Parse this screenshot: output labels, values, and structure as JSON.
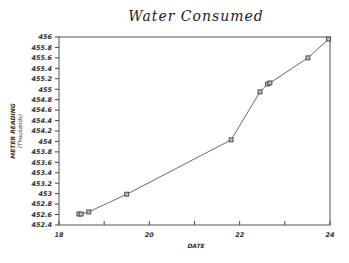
{
  "chart_data": {
    "type": "line",
    "title": "Water Consumed",
    "xlabel": "DATE",
    "ylabel": "METER READING",
    "ylabel_sub": "(Thousands)",
    "xlim": [
      18,
      24
    ],
    "ylim": [
      452.4,
      456
    ],
    "x_ticks": [
      18,
      19,
      20,
      21,
      22,
      23,
      24
    ],
    "x_tick_labels": [
      "18",
      "",
      "20",
      "",
      "22",
      "",
      "24"
    ],
    "y_ticks": [
      452.4,
      452.6,
      452.8,
      453,
      453.2,
      453.4,
      453.6,
      453.8,
      454,
      454.2,
      454.4,
      454.6,
      454.8,
      455,
      455.2,
      455.4,
      455.6,
      455.8,
      456
    ],
    "y_tick_labels": [
      "452.4",
      "452.6",
      "452.8",
      "453",
      "453.2",
      "453.4",
      "453.6",
      "453.8",
      "454",
      "454.2",
      "454.4",
      "454.6",
      "454.8",
      "455",
      "455.2",
      "455.4",
      "455.6",
      "455.8",
      "456"
    ],
    "grid": false,
    "legend": null,
    "marker": "square",
    "series": [
      {
        "name": "Meter Reading",
        "x": [
          18.44,
          18.49,
          18.66,
          19.5,
          21.81,
          22.45,
          22.62,
          22.67,
          23.51,
          23.97
        ],
        "y": [
          452.61,
          452.61,
          452.65,
          452.99,
          454.03,
          454.95,
          455.1,
          455.12,
          455.6,
          455.96
        ]
      }
    ]
  }
}
